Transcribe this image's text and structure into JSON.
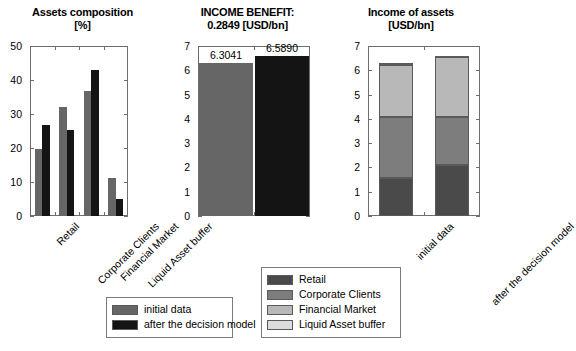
{
  "chart_data": [
    {
      "type": "bar",
      "title": "Assets composition\n[%]",
      "title_line1": "Assets composition",
      "title_line2": "[%]",
      "xlabel": "",
      "ylabel": "",
      "ylim": [
        0,
        50
      ],
      "yticks": [
        0,
        10,
        20,
        30,
        40,
        50
      ],
      "categories": [
        "Retail",
        "Corporate Clients",
        "Financial Market",
        "Liquid Asset buffer"
      ],
      "series": [
        {
          "name": "initial data",
          "color": "#666666",
          "values": [
            19.8,
            32.2,
            36.8,
            11.1
          ]
        },
        {
          "name": "after the decision model",
          "color": "#141414",
          "values": [
            26.8,
            25.4,
            43.0,
            4.9
          ]
        }
      ],
      "grid": false
    },
    {
      "type": "bar",
      "title": "INCOME BENEFIT:\n0.2849 [USD/bn]",
      "title_line1": "INCOME BENEFIT:",
      "title_line2": "0.2849 [USD/bn]",
      "benefit_value": "0.2849",
      "benefit_units": "[USD/bn]",
      "xlabel": "",
      "ylabel": "",
      "ylim": [
        0,
        7
      ],
      "yticks": [
        0,
        1,
        2,
        3,
        4,
        5,
        6,
        7
      ],
      "categories": [
        "initial data",
        "after the decision model"
      ],
      "values": [
        6.3041,
        6.589
      ],
      "data_labels": [
        "6.3041",
        "6.5890"
      ],
      "colors": [
        "#666666",
        "#141414"
      ],
      "grid": false
    },
    {
      "type": "bar",
      "subtype": "stacked",
      "title": "Income of assets\n[USD/bn]",
      "title_line1": "Income of assets",
      "title_line2": "[USD/bn]",
      "xlabel": "",
      "ylabel": "",
      "ylim": [
        0,
        7
      ],
      "yticks": [
        0,
        1,
        2,
        3,
        4,
        5,
        6,
        7
      ],
      "categories": [
        "initial data",
        "after the decision model"
      ],
      "series": [
        {
          "name": "Retail",
          "color": "#4a4a4a",
          "values": [
            1.57,
            2.09
          ]
        },
        {
          "name": "Corporate Clients",
          "color": "#7d7d7d",
          "values": [
            2.49,
            1.97
          ]
        },
        {
          "name": "Financial Market",
          "color": "#b8b8b8",
          "values": [
            2.15,
            2.5
          ]
        },
        {
          "name": "Liquid Asset buffer",
          "color": "#dcdcdc",
          "values": [
            0.09,
            0.03
          ]
        }
      ],
      "totals": [
        6.3041,
        6.589
      ],
      "grid": false
    }
  ],
  "legend_models": {
    "items": [
      {
        "label": "initial data",
        "color": "#666666"
      },
      {
        "label": "after the decision model",
        "color": "#141414"
      }
    ]
  },
  "legend_assets": {
    "items": [
      {
        "label": "Retail",
        "color": "#4a4a4a"
      },
      {
        "label": "Corporate Clients",
        "color": "#7d7d7d"
      },
      {
        "label": "Financial Market",
        "color": "#b8b8b8"
      },
      {
        "label": "Liquid Asset buffer",
        "color": "#dcdcdc"
      }
    ]
  },
  "colors": {
    "axis": "#6e6e6e",
    "background": "#ffffff",
    "initial": "#666666",
    "after": "#141414"
  }
}
